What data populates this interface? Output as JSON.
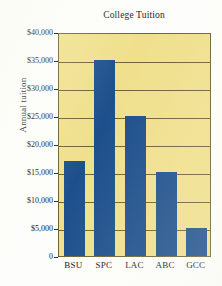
{
  "chart_data": {
    "type": "bar",
    "title": "College Tuition",
    "xlabel": "",
    "ylabel": "Annual tuition",
    "categories": [
      "BSU",
      "SPC",
      "LAC",
      "ABC",
      "GCC"
    ],
    "values": [
      17000,
      35000,
      25000,
      15000,
      5000
    ],
    "ylim": [
      0,
      40000
    ],
    "ytick_step": 5000,
    "ytick_labels": [
      "$40,000",
      "$35,000",
      "$30,000",
      "$25,000",
      "$20,000",
      "$15,000",
      "$10,000",
      "$5,000",
      "0"
    ],
    "ytick_values": [
      40000,
      35000,
      30000,
      25000,
      20000,
      15000,
      10000,
      5000,
      0
    ],
    "grid": true,
    "legend": null,
    "colors": {
      "bar": "#1d4f8c",
      "plot_background": "#f0e08d",
      "grid": "#6e6233",
      "axis": "#3a3320",
      "page_background": "#fdfdfb",
      "text": "#15151a"
    }
  }
}
